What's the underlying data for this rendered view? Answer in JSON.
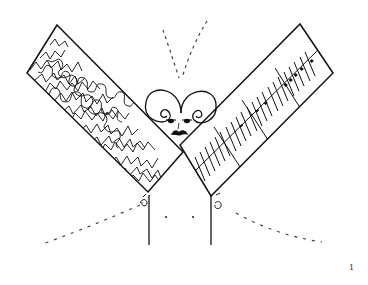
{
  "figure": {
    "page_number": "1",
    "ink_color": "#111111",
    "dotted_color": "#444444",
    "background": "#ffffff"
  },
  "elements": {
    "left_board": {
      "label": "scribble-filled board"
    },
    "right_board": {
      "label": "ruler board with tick marks"
    },
    "head": {
      "label": "head with curly hair, eyes and mustache"
    },
    "legs": {
      "label": "two vertical stems"
    }
  }
}
